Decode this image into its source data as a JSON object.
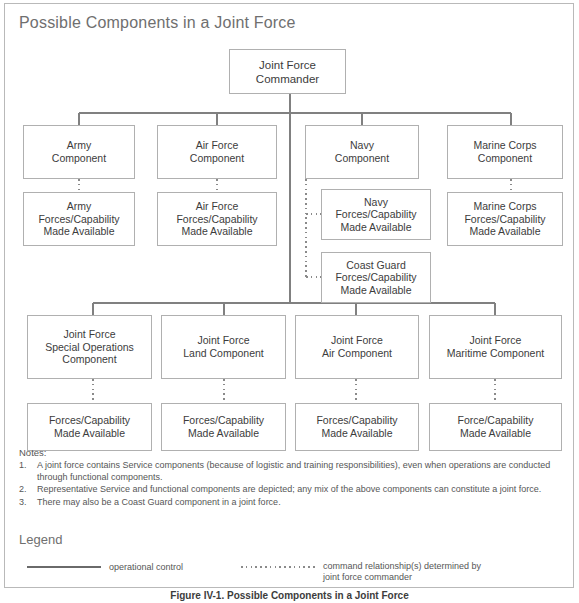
{
  "figure": {
    "title": "Possible Components in a Joint Force",
    "caption": "Figure IV-1. Possible Components in a Joint Force"
  },
  "nodes": {
    "commander": "Joint Force\nCommander",
    "service_components": [
      {
        "component": "Army\nComponent",
        "forces": "Army\nForces/Capability\nMade Available"
      },
      {
        "component": "Air Force\nComponent",
        "forces": "Air Force\nForces/Capability\nMade Available"
      },
      {
        "component": "Navy\nComponent",
        "forces": "Navy\nForces/Capability\nMade Available",
        "forces2": "Coast Guard\nForces/Capability\nMade Available"
      },
      {
        "component": "Marine Corps\nComponent",
        "forces": "Marine Corps\nForces/Capability\nMade Available"
      }
    ],
    "functional_components": [
      {
        "component": "Joint Force\nSpecial Operations\nComponent",
        "forces": "Forces/Capability\nMade Available"
      },
      {
        "component": "Joint Force\nLand Component",
        "forces": "Forces/Capability\nMade Available"
      },
      {
        "component": "Joint Force\nAir Component",
        "forces": "Forces/Capability\nMade Available"
      },
      {
        "component": "Joint Force\nMaritime Component",
        "forces": "Force/Capability\nMade Available"
      }
    ]
  },
  "notes": {
    "heading": "Notes:",
    "items": [
      {
        "num": "1.",
        "text": "A joint force contains Service components (because of logistic and training responsibilities), even when operations are conducted through functional components."
      },
      {
        "num": "2.",
        "text": "Representative Service and functional components are depicted; any mix of the above components can constitute a joint force."
      },
      {
        "num": "3.",
        "text": "There may also be a Coast Guard component in a joint force."
      }
    ]
  },
  "legend": {
    "heading": "Legend",
    "solid_label": "operational control",
    "dotted_label": "command relationship(s) determined by\njoint force commander"
  },
  "colors": {
    "border": "#b0b0b0",
    "line": "#808080",
    "text": "#3c3c3c",
    "title": "#6f6f6f"
  }
}
